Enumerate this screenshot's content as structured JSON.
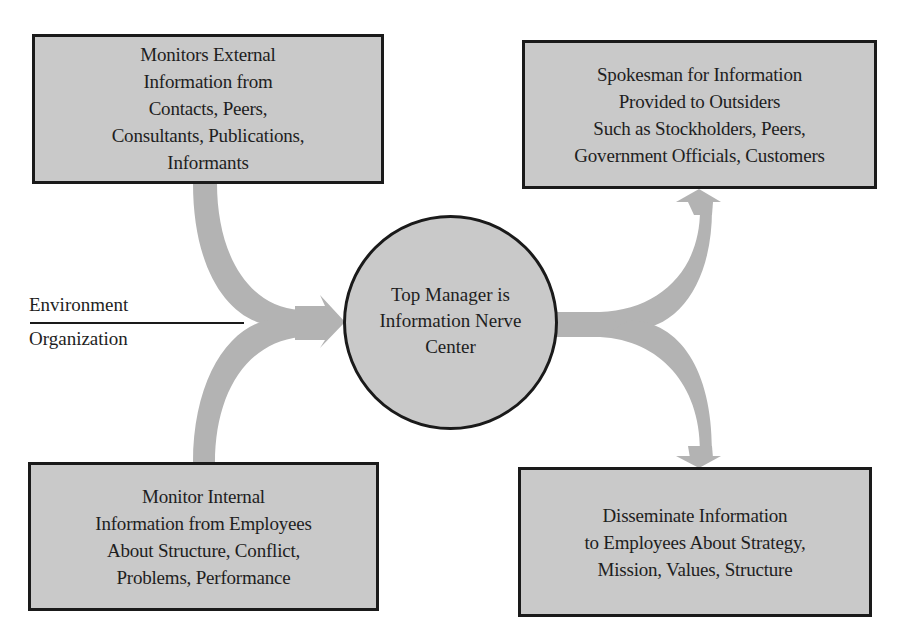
{
  "diagram": {
    "colors": {
      "box_fill": "#c9c9c9",
      "box_border": "#1a1a1a",
      "arrow_fill": "#b3b3b3",
      "background": "#ffffff"
    },
    "center": {
      "label_lines": [
        "Top Manager is",
        "Information Nerve",
        "Center"
      ]
    },
    "boundary": {
      "upper_label": "Environment",
      "lower_label": "Organization"
    },
    "boxes": {
      "top_left": {
        "label_lines": [
          "Monitors External",
          "Information from",
          "Contacts, Peers,",
          "Consultants, Publications,",
          "Informants"
        ]
      },
      "top_right": {
        "label_lines": [
          "Spokesman for Information",
          "Provided to Outsiders",
          "Such as Stockholders, Peers,",
          "Government Officials, Customers"
        ]
      },
      "bottom_left": {
        "label_lines": [
          "Monitor Internal",
          "Information from Employees",
          "About Structure, Conflict,",
          "Problems, Performance"
        ]
      },
      "bottom_right": {
        "label_lines": [
          "Disseminate Information",
          "to Employees About Strategy,",
          "Mission, Values, Structure"
        ]
      }
    },
    "arrows": [
      {
        "from": "top_left",
        "to": "center"
      },
      {
        "from": "bottom_left",
        "to": "center"
      },
      {
        "from": "center",
        "to": "top_right"
      },
      {
        "from": "center",
        "to": "bottom_right"
      }
    ]
  }
}
